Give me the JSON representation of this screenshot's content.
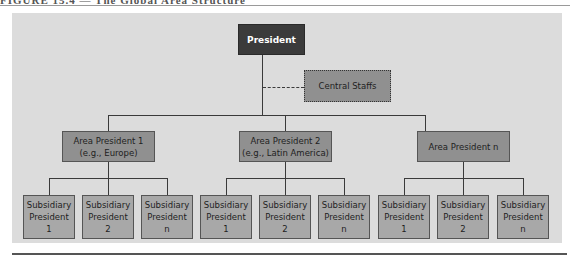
{
  "figure": {
    "caption": "FIGURE 15.4 — The Global Area Structure"
  },
  "chart": {
    "top": {
      "label": "President"
    },
    "staff": {
      "label": "Central Staffs"
    },
    "areas": [
      {
        "line1": "Area President 1",
        "line2": "(e.g., Europe)"
      },
      {
        "line1": "Area President 2",
        "line2": "(e.g., Latin America)"
      },
      {
        "line1": "Area President n",
        "line2": ""
      }
    ],
    "subsidiaries": [
      {
        "line1": "Subsidiary",
        "line2": "President",
        "line3": "1"
      },
      {
        "line1": "Subsidiary",
        "line2": "President",
        "line3": "2"
      },
      {
        "line1": "Subsidiary",
        "line2": "President",
        "line3": "n"
      },
      {
        "line1": "Subsidiary",
        "line2": "President",
        "line3": "1"
      },
      {
        "line1": "Subsidiary",
        "line2": "President",
        "line3": "2"
      },
      {
        "line1": "Subsidiary",
        "line2": "President",
        "line3": "n"
      },
      {
        "line1": "Subsidiary",
        "line2": "President",
        "line3": "1"
      },
      {
        "line1": "Subsidiary",
        "line2": "President",
        "line3": "2"
      },
      {
        "line1": "Subsidiary",
        "line2": "President",
        "line3": "n"
      }
    ]
  },
  "colors": {
    "panel_bg": "#dcdcdc",
    "president_bg": "#3b3b3b",
    "area_bg": "#909090",
    "staff_bg": "#909090",
    "subsidiary_bg": "#a8a8a8",
    "line": "#3a3a3a"
  }
}
